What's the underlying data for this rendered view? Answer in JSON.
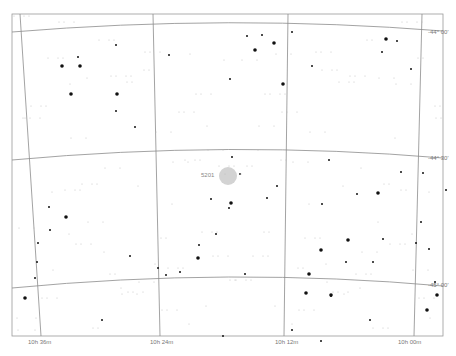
{
  "map": {
    "type": "star-chart",
    "background": "#ffffff",
    "frame": {
      "x1": 12,
      "y1": 14,
      "x2": 443,
      "y2": 336,
      "color": "#888888"
    },
    "ra_labels": [
      {
        "text": "10h 36m",
        "x": 28
      },
      {
        "text": "10h 24m",
        "x": 150
      },
      {
        "text": "10h 12m",
        "x": 275
      },
      {
        "text": "10h 00m",
        "x": 398
      }
    ],
    "dec_labels": [
      {
        "text": "-44° 00'",
        "y": 32
      },
      {
        "text": "-44° 30'",
        "y": 158
      },
      {
        "text": "-45° 00'",
        "y": 285
      }
    ],
    "object": {
      "label": "5201",
      "x": 228,
      "y": 176,
      "r": 9,
      "color": "#d3d3d3"
    },
    "grid_color": "#8c8c8c"
  }
}
